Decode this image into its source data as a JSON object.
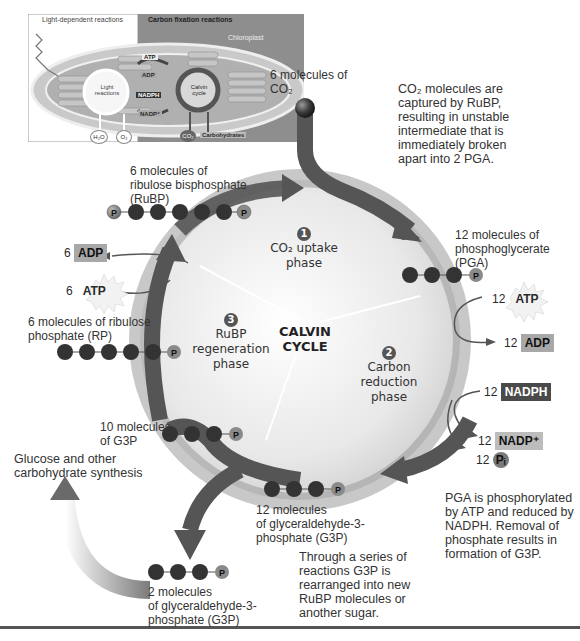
{
  "inset": {
    "left_header": "Light-dependent reactions",
    "right_header": "Carbon fixation reactions",
    "organelle_label": "Chloroplast",
    "light_reactions": "Light reactions",
    "calvin_cycle": "Calvin cycle",
    "atp": "ATP",
    "adp": "ADP",
    "nadph": "NADPH",
    "nadp": "NADP⁺",
    "h2o": "H₂O",
    "o2": "O₂",
    "co2": "CO₂",
    "carbohydrates": "Carbohydrates"
  },
  "center": {
    "title_line1": "CALVIN",
    "title_line2": "CYCLE",
    "phases": [
      {
        "num": "1",
        "line1": "CO₂ uptake",
        "line2": "phase"
      },
      {
        "num": "2",
        "line1": "Carbon",
        "line2": "reduction",
        "line3": "phase"
      },
      {
        "num": "3",
        "line1": "RuBP",
        "line2": "regeneration",
        "line3": "phase"
      }
    ]
  },
  "labels": {
    "co2_in_line1": "6 molecules of",
    "co2_in_line2": "CO₂",
    "rubp_line1": "6 molecules of",
    "rubp_line2": "ribulose bisphosphate",
    "rubp_line3": "(RuBP)",
    "pga_line1": "12 molecules of",
    "pga_line2": "phosphoglycerate",
    "pga_line3": "(PGA)",
    "rp_line1": "6 molecules of ribulose",
    "rp_line2": "phosphate (RP)",
    "g3p10_line1": "10 molecules",
    "g3p10_line2": "of G3P",
    "glucose_line1": "Glucose and other",
    "glucose_line2": "carbohydrate synthesis",
    "g3p12_line1": "12 molecules",
    "g3p12_line2": "of glyceraldehyde-3-",
    "g3p12_line3": "phosphate (G3P)",
    "g3p2_line1": "2 molecules",
    "g3p2_line2": "of glyceraldehyde-3-",
    "g3p2_line3": "phosphate (G3P)"
  },
  "energy": {
    "atp_in_count": "12",
    "atp_in": "ATP",
    "adp_out_count": "12",
    "adp_out": "ADP",
    "nadph_count": "12",
    "nadph": "NADPH",
    "nadp_count": "12",
    "nadp": "NADP⁺",
    "pi_count": "12",
    "pi": "Pᵢ",
    "regen_atp_count": "6",
    "regen_atp": "ATP",
    "regen_adp_count": "6",
    "regen_adp": "ADP"
  },
  "notes": {
    "uptake": [
      "CO₂ molecules are",
      "captured by RuBP,",
      "resulting in unstable",
      "intermediate that is",
      "immediately broken",
      "apart into 2 PGA."
    ],
    "reduction": [
      "PGA is phosphorylated",
      "by ATP and reduced by",
      "NADPH. Removal of",
      "phosphate results in",
      "formation of G3P."
    ],
    "regeneration": [
      "Through a series of",
      "reactions G3P is",
      "rearranged into new",
      "RuBP molecules or",
      "another sugar."
    ]
  },
  "molecule_p": "P",
  "colors": {
    "arrow": "#555555",
    "sphere": "#3a3a3a",
    "ring": "#8a8a8a",
    "tag_light": "#a8a8a8",
    "tag_dark": "#4a4a4a"
  }
}
